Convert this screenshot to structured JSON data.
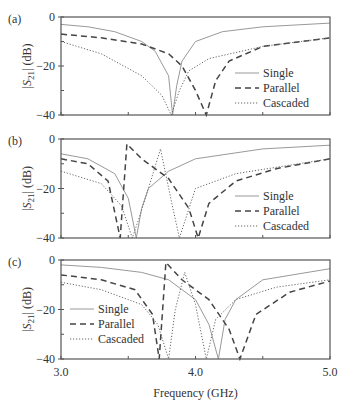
{
  "chart_data": {
    "type": "line",
    "xlabel": "Frequency (GHz)",
    "ylabel": "|S21| (dB)",
    "xlim": [
      3.0,
      5.0
    ],
    "ylim": [
      -40,
      0
    ],
    "x_ticks": [
      "3.0",
      "4.0",
      "5.0"
    ],
    "y_ticks": [
      "0",
      "-20",
      "-40"
    ],
    "legend": [
      "Single",
      "Parallel",
      "Cascaded"
    ],
    "panels": [
      {
        "label": "(a)",
        "legend_position": "lower right",
        "series": [
          {
            "name": "Single",
            "style": "solid",
            "x": [
              3.0,
              3.2,
              3.4,
              3.6,
              3.7,
              3.8,
              3.83,
              3.86,
              3.9,
              4.0,
              4.2,
              4.5,
              5.0
            ],
            "y": [
              -3,
              -4,
              -6,
              -10,
              -14,
              -24,
              -40,
              -28,
              -18,
              -10,
              -6,
              -4,
              -2.5
            ]
          },
          {
            "name": "Parallel",
            "style": "dashed",
            "x": [
              3.0,
              3.3,
              3.6,
              3.8,
              3.9,
              4.0,
              4.08,
              4.15,
              4.25,
              4.5,
              5.0
            ],
            "y": [
              -7,
              -8.5,
              -11,
              -15,
              -20,
              -30,
              -40,
              -26,
              -18,
              -12,
              -8.5
            ]
          },
          {
            "name": "Cascaded",
            "style": "dotted",
            "x": [
              3.0,
              3.3,
              3.6,
              3.75,
              3.82,
              3.88,
              3.95,
              4.1,
              4.5,
              5.0
            ],
            "y": [
              -10,
              -15,
              -24,
              -32,
              -40,
              -30,
              -22,
              -17,
              -12,
              -8.5
            ]
          }
        ]
      },
      {
        "label": "(b)",
        "legend_position": "lower right",
        "series": [
          {
            "name": "Single",
            "style": "solid",
            "x": [
              3.0,
              3.2,
              3.4,
              3.5,
              3.56,
              3.6,
              3.65,
              3.8,
              4.0,
              4.5,
              5.0
            ],
            "y": [
              -6,
              -8,
              -14,
              -24,
              -40,
              -28,
              -20,
              -13,
              -8,
              -4,
              -2.5
            ]
          },
          {
            "name": "Parallel",
            "style": "dashed",
            "x": [
              3.0,
              3.2,
              3.35,
              3.44,
              3.49,
              3.6,
              3.8,
              3.95,
              4.02,
              4.1,
              4.3,
              4.6,
              5.0
            ],
            "y": [
              -8,
              -10,
              -17,
              -40,
              -2,
              -8,
              -16,
              -28,
              -40,
              -26,
              -17,
              -12,
              -8
            ]
          },
          {
            "name": "Cascaded",
            "style": "dotted",
            "x": [
              3.0,
              3.3,
              3.45,
              3.53,
              3.58,
              3.65,
              3.74,
              3.82,
              3.88,
              4.0,
              4.3,
              5.0
            ],
            "y": [
              -13,
              -18,
              -27,
              -40,
              -32,
              -20,
              -4,
              -25,
              -40,
              -20,
              -14,
              -8
            ]
          }
        ]
      },
      {
        "label": "(c)",
        "legend_position": "lower left",
        "series": [
          {
            "name": "Single",
            "style": "solid",
            "x": [
              3.0,
              3.3,
              3.6,
              3.8,
              4.0,
              4.1,
              4.17,
              4.22,
              4.3,
              4.5,
              5.0
            ],
            "y": [
              -2,
              -3,
              -5,
              -8,
              -16,
              -26,
              -40,
              -24,
              -16,
              -8,
              -3.5
            ]
          },
          {
            "name": "Parallel",
            "style": "dashed",
            "x": [
              3.0,
              3.3,
              3.55,
              3.68,
              3.73,
              3.78,
              3.9,
              4.1,
              4.25,
              4.33,
              4.45,
              4.7,
              5.0
            ],
            "y": [
              -6,
              -8,
              -12,
              -22,
              -40,
              -1,
              -8,
              -16,
              -28,
              -40,
              -22,
              -13,
              -8.5
            ]
          },
          {
            "name": "Cascaded",
            "style": "dotted",
            "x": [
              3.0,
              3.3,
              3.6,
              3.72,
              3.8,
              3.85,
              3.92,
              4.0,
              4.08,
              4.15,
              4.3,
              4.6,
              5.0
            ],
            "y": [
              -9,
              -12,
              -18,
              -26,
              -40,
              -20,
              -5,
              -18,
              -40,
              -24,
              -16,
              -11,
              -8
            ]
          }
        ]
      }
    ]
  }
}
